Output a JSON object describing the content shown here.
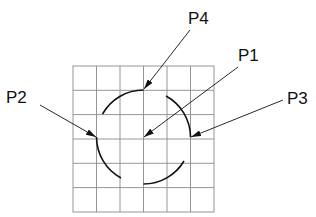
{
  "diagram": {
    "grid": {
      "x": 73,
      "y": 66,
      "cols": 6,
      "rows": 6,
      "cell_w": 23.5,
      "cell_h": 24.3,
      "color": "#8a8a8a"
    },
    "circle": {
      "cx": 143.5,
      "cy": 137,
      "r": 47,
      "color": "#111111"
    },
    "labels": [
      {
        "id": "P4",
        "text": "P4"
      },
      {
        "id": "P1",
        "text": "P1"
      },
      {
        "id": "P2",
        "text": "P2"
      },
      {
        "id": "P3",
        "text": "P3"
      }
    ]
  }
}
